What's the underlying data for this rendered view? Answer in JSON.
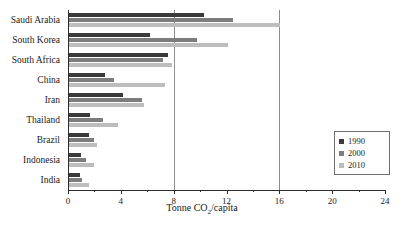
{
  "chart_data": {
    "type": "bar",
    "orientation": "horizontal",
    "title": "",
    "xlabel": "Tonne CO2/capita",
    "xlabel_parts": {
      "pre": "Tonne CO",
      "sub": "2",
      "post": "/capita"
    },
    "ylabel": "",
    "xlim": [
      0,
      24
    ],
    "xticks": [
      0,
      4,
      8,
      12,
      16,
      20,
      24
    ],
    "xtick_labels": [
      "0",
      "4",
      "8",
      "12",
      "16",
      "20",
      "24"
    ],
    "x_minor_ticks": [
      2,
      6,
      10,
      14,
      18,
      22
    ],
    "grid": "vertical gridlines at 8 and 16",
    "gridlines": [
      8,
      16
    ],
    "legend_position": "right-inner",
    "categories": [
      "Saudi Arabia",
      "South Korea",
      "South Africa",
      "China",
      "Iran",
      "Thailand",
      "Brazil",
      "Indonesia",
      "India"
    ],
    "series": [
      {
        "name": "1990",
        "color": "#3a3a3a",
        "values": [
          10.2,
          6.1,
          7.5,
          2.7,
          4.1,
          1.6,
          1.5,
          0.9,
          0.8
        ]
      },
      {
        "name": "2000",
        "color": "#7d7d7d",
        "values": [
          12.4,
          9.7,
          7.1,
          3.4,
          5.5,
          2.6,
          1.9,
          1.3,
          1.0
        ]
      },
      {
        "name": "2010",
        "color": "#bdbdbd",
        "values": [
          16.0,
          12.0,
          7.8,
          7.3,
          5.7,
          3.7,
          2.1,
          1.9,
          1.5
        ]
      }
    ]
  },
  "legend": {
    "items": [
      {
        "label": "1990",
        "swatch": "#3a3a3a"
      },
      {
        "label": "2000",
        "swatch": "#7d7d7d"
      },
      {
        "label": "2010",
        "swatch": "#bdbdbd"
      }
    ]
  }
}
